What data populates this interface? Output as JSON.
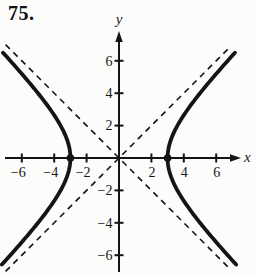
{
  "figure": {
    "problem_number": "75.",
    "x_axis_label": "x",
    "y_axis_label": "y"
  },
  "style": {
    "ink": "#141414",
    "background": "#fcfcfa",
    "curve_width": 3.8,
    "axis_width": 2,
    "tick_width": 2,
    "asymptote_width": 1.6,
    "asymptote_dash": "6 5"
  },
  "chart_data": {
    "type": "line",
    "equation": "x²/9 − y²/9 = 1",
    "center": [
      0,
      0
    ],
    "a": 3,
    "b": 3,
    "vertices": [
      [
        -3,
        0
      ],
      [
        3,
        0
      ]
    ],
    "asymptotes": [
      {
        "slope": 1,
        "intercept": 0,
        "style": "dashed"
      },
      {
        "slope": -1,
        "intercept": 0,
        "style": "dashed"
      }
    ],
    "branch_y_range": [
      -6.6,
      6.5
    ],
    "asymptote_x_range": [
      -7.0,
      6.9
    ],
    "x_ticks": [
      {
        "value": -6,
        "label": "−6"
      },
      {
        "value": -4,
        "label": "−4"
      },
      {
        "value": -2,
        "label": "−2"
      },
      {
        "value": 2,
        "label": "2"
      },
      {
        "value": 4,
        "label": "4"
      },
      {
        "value": 6,
        "label": "6"
      }
    ],
    "y_ticks": [
      {
        "value": 6,
        "label": "6"
      },
      {
        "value": 4,
        "label": "4"
      },
      {
        "value": 2,
        "label": "2"
      },
      {
        "value": -2,
        "label": "−2"
      },
      {
        "value": -4,
        "label": "−4"
      },
      {
        "value": -6,
        "label": "−6"
      }
    ],
    "xlim": [
      -7.2,
      7.5
    ],
    "ylim": [
      -7.2,
      7.8
    ],
    "grid": false
  }
}
